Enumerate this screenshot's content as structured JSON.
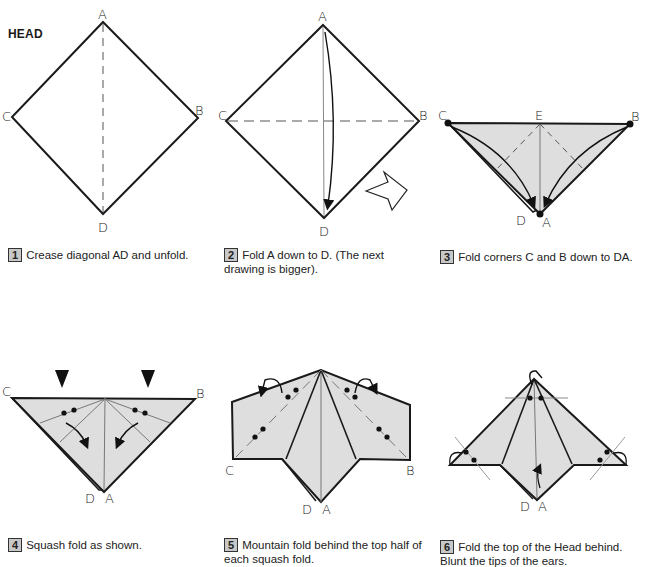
{
  "page": {
    "title": "HEAD"
  },
  "colors": {
    "paper_fill": "#dedede",
    "line": "#1a1a1a",
    "crease": "#666666",
    "step_badge": "#c8c8c8"
  },
  "steps": [
    {
      "number": "1",
      "text": "Crease diagonal AD and unfold.",
      "labels": [
        "A",
        "B",
        "C",
        "D"
      ]
    },
    {
      "number": "2",
      "text": "Fold A down to D. (The next drawing is bigger).",
      "labels": [
        "A",
        "B",
        "C",
        "D"
      ]
    },
    {
      "number": "3",
      "text": "Fold corners C and B down to DA.",
      "labels": [
        "C",
        "E",
        "B",
        "D",
        "A"
      ]
    },
    {
      "number": "4",
      "text": "Squash fold as shown.",
      "labels": [
        "C",
        "B",
        "D",
        "A"
      ]
    },
    {
      "number": "5",
      "text": "Mountain fold behind the top half of each squash fold.",
      "labels": [
        "C",
        "B",
        "D",
        "A"
      ]
    },
    {
      "number": "6",
      "text": "Fold the top of the Head behind. Blunt the tips of the ears.",
      "labels": [
        "D",
        "A"
      ]
    }
  ],
  "icons": {
    "next_arrow": "outline-arrow-right-icon"
  }
}
